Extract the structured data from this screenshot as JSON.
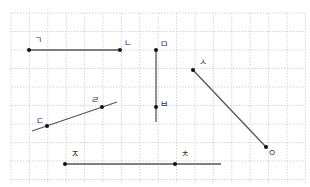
{
  "grid": {
    "x_start": 11,
    "x_end": 305,
    "x_step": 18.4,
    "y_start": 13,
    "y_end": 183,
    "y_step": 18.5,
    "color": "#c8c8c8"
  },
  "figures": [
    {
      "type": "segment",
      "name": "segment-giyeok-nieun",
      "from": [
        29,
        50
      ],
      "to": [
        120,
        50
      ]
    },
    {
      "type": "ray",
      "name": "ray-mieum-bieup",
      "from": [
        156,
        50
      ],
      "to": [
        156,
        122
      ]
    },
    {
      "type": "segment",
      "name": "segment-siot-ieung",
      "from": [
        193,
        70
      ],
      "to": [
        266,
        147
      ]
    },
    {
      "type": "line",
      "name": "line-digeut-rieul",
      "from": [
        32,
        131
      ],
      "to": [
        117,
        102
      ]
    },
    {
      "type": "ray",
      "name": "ray-jieut-chieut",
      "from": [
        65,
        164
      ],
      "to": [
        221,
        164
      ]
    }
  ],
  "points": [
    {
      "label": "ㄱ",
      "x": 29,
      "y": 50,
      "lx": 34,
      "ly": 43
    },
    {
      "label": "ㄴ",
      "x": 120,
      "y": 50,
      "lx": 124,
      "ly": 46
    },
    {
      "label": "ㅁ",
      "x": 156,
      "y": 50,
      "lx": 160,
      "ly": 47
    },
    {
      "label": "ㅂ",
      "x": 156,
      "y": 107,
      "lx": 160,
      "ly": 107
    },
    {
      "label": "ㅅ",
      "x": 193,
      "y": 70,
      "lx": 199,
      "ly": 65
    },
    {
      "label": "ㅇ",
      "x": 266,
      "y": 147,
      "lx": 268,
      "ly": 156
    },
    {
      "label": "ㄷ",
      "x": 47,
      "y": 126,
      "lx": 36,
      "ly": 124
    },
    {
      "label": "ㄹ",
      "x": 102,
      "y": 107,
      "lx": 91,
      "ly": 103
    },
    {
      "label": "ㅈ",
      "x": 65,
      "y": 164,
      "lx": 71,
      "ly": 157
    },
    {
      "label": "ㅊ",
      "x": 175,
      "y": 164,
      "lx": 181,
      "ly": 157
    }
  ]
}
